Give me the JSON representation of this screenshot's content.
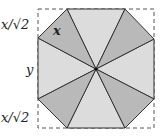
{
  "diagram": {
    "labels": {
      "top_corner": "x/√2",
      "left_side": "y",
      "bottom_corner": "x/√2",
      "triangle_side": "x"
    },
    "square": {
      "x1": 38,
      "y1": 9,
      "x2": 154,
      "y2": 128,
      "style": "dashed"
    },
    "center": {
      "x": 96,
      "y": 69
    },
    "octagon_vertices": [
      {
        "x": 67,
        "y": 9
      },
      {
        "x": 125,
        "y": 9
      },
      {
        "x": 154,
        "y": 39
      },
      {
        "x": 154,
        "y": 99
      },
      {
        "x": 125,
        "y": 128
      },
      {
        "x": 67,
        "y": 128
      },
      {
        "x": 38,
        "y": 99
      },
      {
        "x": 38,
        "y": 38
      }
    ],
    "colors": {
      "light_fill": "#dcdcdc",
      "dark_fill": "#b9b9b9",
      "stroke": "#333333",
      "dash": "#555555"
    }
  }
}
